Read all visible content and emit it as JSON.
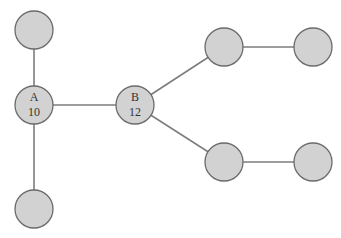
{
  "diagram": {
    "type": "tree-graph",
    "colors": {
      "node_fill": "#d2d2d2",
      "node_stroke": "#6b6b6b",
      "edge": "#7d7d7d",
      "label": "#333333",
      "background": "#ffffff"
    },
    "node_radius": 19,
    "nodes": [
      {
        "id": "top-left",
        "x": 34,
        "y": 30,
        "label": "",
        "value": ""
      },
      {
        "id": "A",
        "x": 34,
        "y": 105,
        "label": "A",
        "value": "10"
      },
      {
        "id": "bottom-left",
        "x": 34,
        "y": 209,
        "label": "",
        "value": ""
      },
      {
        "id": "B",
        "x": 135,
        "y": 105,
        "label": "B",
        "value": "12"
      },
      {
        "id": "upper-mid",
        "x": 224,
        "y": 47,
        "label": "",
        "value": ""
      },
      {
        "id": "upper-right",
        "x": 313,
        "y": 47,
        "label": "",
        "value": ""
      },
      {
        "id": "lower-mid",
        "x": 224,
        "y": 162,
        "label": "",
        "value": ""
      },
      {
        "id": "lower-right",
        "x": 313,
        "y": 162,
        "label": "",
        "value": ""
      }
    ],
    "edges": [
      {
        "from": "top-left",
        "to": "A"
      },
      {
        "from": "A",
        "to": "bottom-left"
      },
      {
        "from": "A",
        "to": "B"
      },
      {
        "from": "B",
        "to": "upper-mid"
      },
      {
        "from": "B",
        "to": "lower-mid"
      },
      {
        "from": "upper-mid",
        "to": "upper-right"
      },
      {
        "from": "lower-mid",
        "to": "lower-right"
      }
    ]
  }
}
